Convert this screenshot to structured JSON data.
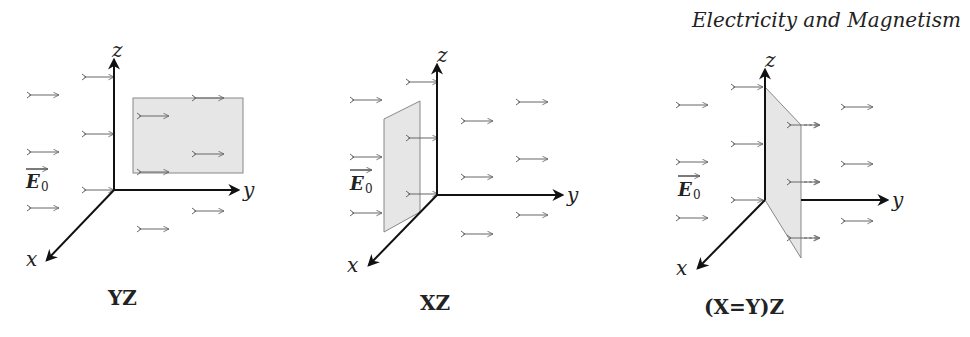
{
  "header": {
    "title": "Electricity and Magnetism"
  },
  "field_label": {
    "symbol": "E",
    "subscript": "0"
  },
  "axes": {
    "x": "x",
    "y": "y",
    "z": "z"
  },
  "panels": [
    {
      "id": "yz",
      "caption": "YZ",
      "plane": "yz-plane (rectangle parallel to field)"
    },
    {
      "id": "xz",
      "caption": "XZ",
      "plane": "xz-plane (perpendicular to field)"
    },
    {
      "id": "xyz",
      "caption": "(X=Y)Z",
      "plane": "diagonal plane x=y"
    }
  ],
  "colors": {
    "axis": "#111111",
    "field_arrow": "#666666",
    "plane_fill": "#e6e6e6",
    "plane_stroke": "#888888"
  }
}
